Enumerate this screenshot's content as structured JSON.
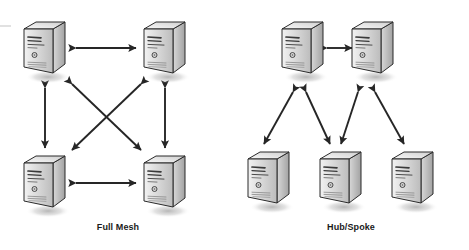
{
  "diagram": {
    "type": "network-topology",
    "background_color": "#ffffff",
    "width": 469,
    "height": 250,
    "label_color": "#1a1a1a",
    "arrow_color": "#262626",
    "node_icon_name": "server-tower-icon",
    "groups": [
      {
        "id": "full-mesh",
        "label": "Full Mesh",
        "label_x": 118,
        "label_y": 228,
        "node_count": 4,
        "link_count": 6,
        "nodes": [
          {
            "id": "fm-node-1",
            "name": "server-top-left",
            "x": 20,
            "y": 18
          },
          {
            "id": "fm-node-2",
            "name": "server-top-right",
            "x": 140,
            "y": 18
          },
          {
            "id": "fm-node-3",
            "name": "server-bottom-left",
            "x": 20,
            "y": 152
          },
          {
            "id": "fm-node-4",
            "name": "server-bottom-right",
            "x": 140,
            "y": 152
          }
        ],
        "links": [
          {
            "id": "fm-link-top",
            "from": "fm-node-1",
            "to": "fm-node-2",
            "x1": 76,
            "y1": 48,
            "x2": 136,
            "y2": 48,
            "style": "double-arrow"
          },
          {
            "id": "fm-link-bottom",
            "from": "fm-node-3",
            "to": "fm-node-4",
            "x1": 76,
            "y1": 183,
            "x2": 136,
            "y2": 183,
            "style": "double-arrow"
          },
          {
            "id": "fm-link-left",
            "from": "fm-node-1",
            "to": "fm-node-3",
            "x1": 45,
            "y1": 88,
            "x2": 45,
            "y2": 148,
            "style": "double-arrow"
          },
          {
            "id": "fm-link-right",
            "from": "fm-node-2",
            "to": "fm-node-4",
            "x1": 165,
            "y1": 88,
            "x2": 165,
            "y2": 148,
            "style": "double-arrow"
          },
          {
            "id": "fm-link-diagonal-1",
            "from": "fm-node-1",
            "to": "fm-node-4",
            "x1": 72,
            "y1": 84,
            "x2": 141,
            "y2": 150,
            "style": "double-arrow"
          },
          {
            "id": "fm-link-diagonal-2",
            "from": "fm-node-2",
            "to": "fm-node-3",
            "x1": 141,
            "y1": 84,
            "x2": 72,
            "y2": 150,
            "style": "double-arrow"
          }
        ]
      },
      {
        "id": "hub-spoke",
        "label": "Hub/Spoke",
        "label_x": 351,
        "label_y": 228,
        "node_count": 5,
        "link_count": 5,
        "nodes": [
          {
            "id": "hs-hub-1",
            "name": "hub-server-left",
            "x": 278,
            "y": 18,
            "role": "hub"
          },
          {
            "id": "hs-hub-2",
            "name": "hub-server-right",
            "x": 348,
            "y": 18,
            "role": "hub"
          },
          {
            "id": "hs-spoke-1",
            "name": "spoke-server-left",
            "x": 244,
            "y": 148,
            "role": "spoke"
          },
          {
            "id": "hs-spoke-2",
            "name": "spoke-server-mid",
            "x": 316,
            "y": 148,
            "role": "spoke"
          },
          {
            "id": "hs-spoke-3",
            "name": "spoke-server-right",
            "x": 388,
            "y": 148,
            "role": "spoke"
          }
        ],
        "links": [
          {
            "id": "hs-link-hub-hub",
            "from": "hs-hub-1",
            "to": "hs-hub-2",
            "x1": 327,
            "y1": 48,
            "x2": 352,
            "y2": 48,
            "style": "double-arrow"
          },
          {
            "id": "hs-link-h1-s1",
            "from": "hs-hub-1",
            "to": "hs-spoke-1",
            "x1": 293,
            "y1": 92,
            "x2": 264,
            "y2": 144,
            "style": "double-arrow"
          },
          {
            "id": "hs-link-h1-s2",
            "from": "hs-hub-1",
            "to": "hs-spoke-2",
            "x1": 306,
            "y1": 92,
            "x2": 330,
            "y2": 144,
            "style": "double-arrow"
          },
          {
            "id": "hs-link-h2-s2",
            "from": "hs-hub-2",
            "to": "hs-spoke-2",
            "x1": 358,
            "y1": 92,
            "x2": 341,
            "y2": 144,
            "style": "double-arrow"
          },
          {
            "id": "hs-link-h2-s3",
            "from": "hs-hub-2",
            "to": "hs-spoke-3",
            "x1": 375,
            "y1": 92,
            "x2": 404,
            "y2": 144,
            "style": "double-arrow"
          }
        ]
      }
    ]
  }
}
